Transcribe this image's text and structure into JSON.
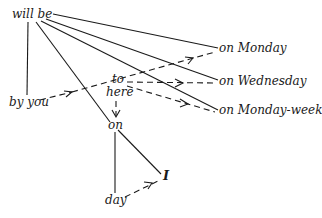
{
  "diagram": {
    "type": "dependency-tree",
    "nodes": {
      "will_be": "will be",
      "on_monday": "on Monday",
      "on_wednesday": "on Wednesday",
      "on_monday_week": "on Monday-week",
      "by_you": "by you",
      "to": "to",
      "here": "here",
      "on": "on",
      "I": "I",
      "day": "day"
    },
    "solid_edges": [
      [
        "will be",
        "on Monday"
      ],
      [
        "will be",
        "on Wednesday"
      ],
      [
        "will be",
        "on Monday-week"
      ],
      [
        "will be",
        "by you"
      ],
      [
        "will be",
        "on"
      ],
      [
        "on",
        "day"
      ],
      [
        "on",
        "I"
      ]
    ],
    "dashed_arrows": [
      [
        "by you",
        "on Monday"
      ],
      [
        "to",
        "on Wednesday"
      ],
      [
        "to",
        "on Monday-week"
      ],
      [
        "here",
        "on"
      ],
      [
        "day",
        "I"
      ]
    ],
    "colors": {
      "ink": "#1a1a1a",
      "background": "#ffffff"
    }
  }
}
